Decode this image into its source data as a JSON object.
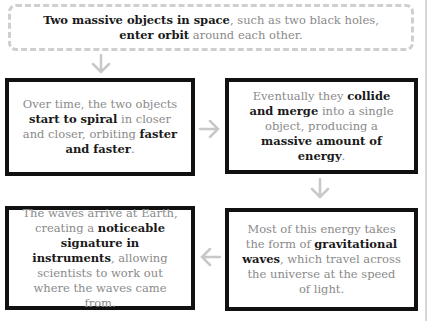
{
  "diagram": {
    "intro": {
      "parts": [
        {
          "text": "Two massive objects in space",
          "bold": true
        },
        {
          "text": ", such as two black holes, ",
          "bold": false
        },
        {
          "text": "enter orbit",
          "bold": true
        },
        {
          "text": " around each other.",
          "bold": false
        }
      ]
    },
    "steps": [
      {
        "parts": [
          {
            "text": "Over time, the two objects ",
            "bold": false
          },
          {
            "text": "start to spiral",
            "bold": true
          },
          {
            "text": " in closer and closer, orbiting ",
            "bold": false
          },
          {
            "text": "faster and faster",
            "bold": true
          },
          {
            "text": ".",
            "bold": false
          }
        ]
      },
      {
        "parts": [
          {
            "text": "Eventually they ",
            "bold": false
          },
          {
            "text": "collide and merge",
            "bold": true
          },
          {
            "text": " into a single object, producing a ",
            "bold": false
          },
          {
            "text": "massive amount of energy",
            "bold": true
          },
          {
            "text": ".",
            "bold": false
          }
        ]
      },
      {
        "parts": [
          {
            "text": "The waves arrive at Earth, creating a ",
            "bold": false
          },
          {
            "text": "noticeable signature in instruments",
            "bold": true
          },
          {
            "text": ", allowing scientists to work out where the waves came from.",
            "bold": false
          }
        ]
      },
      {
        "parts": [
          {
            "text": "Most of this energy takes the form of ",
            "bold": false
          },
          {
            "text": "gravitational waves",
            "bold": true
          },
          {
            "text": ", which travel across the universe at the speed of light.",
            "bold": false
          }
        ]
      }
    ],
    "arrows": [
      {
        "from": "intro",
        "to": "step-1",
        "direction": "down"
      },
      {
        "from": "step-1",
        "to": "step-2",
        "direction": "right"
      },
      {
        "from": "step-2",
        "to": "step-4",
        "direction": "down"
      },
      {
        "from": "step-4",
        "to": "step-3",
        "direction": "left"
      }
    ],
    "colors": {
      "box_border": "#111111",
      "intro_border": "#cfcfcf",
      "arrow": "#c8c8c8",
      "bold_text": "#1a1a1a",
      "text": "#8a8a8a"
    }
  }
}
